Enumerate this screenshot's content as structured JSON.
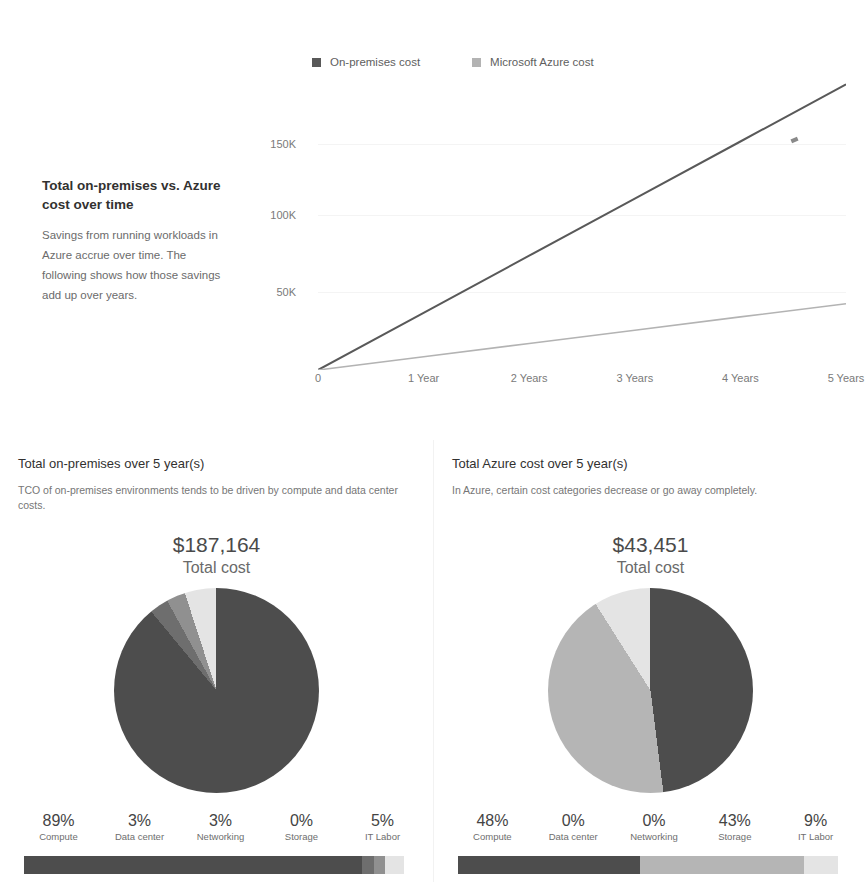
{
  "colors": {
    "onprem_line": "#595959",
    "azure_line": "#b3b3b3",
    "slice_compute": "#4d4d4d",
    "slice_datacenter": "#6e6e6e",
    "slice_networking": "#909090",
    "slice_storage": "#b5b5b5",
    "slice_itlabor": "#e4e4e4",
    "text_primary": "#323130",
    "text_muted": "#6b6b6b"
  },
  "overview": {
    "title": "Total on-premises vs. Azure cost over time",
    "body": "Savings from running workloads in Azure accrue over time. The following shows how those savings add up over years."
  },
  "chart_data": {
    "type": "line",
    "title": "Total on-premises vs. Azure cost over time",
    "xlabel": "",
    "ylabel": "",
    "x": [
      0,
      1,
      2,
      3,
      4,
      5
    ],
    "x_tick_labels": [
      "0",
      "1 Year",
      "2 Years",
      "3 Years",
      "4 Years",
      "5 Years"
    ],
    "y_tick_labels": [
      "50K",
      "100K",
      "150K"
    ],
    "y_tick_values": [
      50000,
      100000,
      150000
    ],
    "ylim": [
      0,
      190000
    ],
    "grid": false,
    "legend_position": "top",
    "series": [
      {
        "name": "On-premises cost",
        "color": "#595959",
        "values": [
          0,
          37433,
          74866,
          112298,
          149731,
          187164
        ]
      },
      {
        "name": "Microsoft Azure cost",
        "color": "#b3b3b3",
        "values": [
          0,
          8690,
          17380,
          26071,
          34761,
          43451
        ]
      }
    ]
  },
  "panels": [
    {
      "id": "on-premises",
      "title": "Total on-premises over 5 year(s)",
      "subtitle": "TCO of on-premises environments tends to be driven by compute and data center costs.",
      "total_amount": "$187,164",
      "total_caption": "Total cost",
      "pie": {
        "type": "pie",
        "labels": [
          "Compute",
          "Data center",
          "Networking",
          "Storage",
          "IT Labor"
        ],
        "percentages": [
          89,
          3,
          3,
          0,
          5
        ],
        "colors": [
          "#4d4d4d",
          "#6e6e6e",
          "#909090",
          "#b5b5b5",
          "#e4e4e4"
        ]
      },
      "breakdown": [
        {
          "pct": "89%",
          "name": "Compute",
          "color": "#4d4d4d",
          "width": 89
        },
        {
          "pct": "3%",
          "name": "Data center",
          "color": "#6e6e6e",
          "width": 3
        },
        {
          "pct": "3%",
          "name": "Networking",
          "color": "#909090",
          "width": 3
        },
        {
          "pct": "0%",
          "name": "Storage",
          "color": "#b5b5b5",
          "width": 0
        },
        {
          "pct": "5%",
          "name": "IT Labor",
          "color": "#e4e4e4",
          "width": 5
        }
      ]
    },
    {
      "id": "azure",
      "title": "Total Azure cost over 5 year(s)",
      "subtitle": "In Azure, certain cost categories decrease or go away completely.",
      "total_amount": "$43,451",
      "total_caption": "Total cost",
      "pie": {
        "type": "pie",
        "labels": [
          "Compute",
          "Data center",
          "Networking",
          "Storage",
          "IT Labor"
        ],
        "percentages": [
          48,
          0,
          0,
          43,
          9
        ],
        "colors": [
          "#4d4d4d",
          "#6e6e6e",
          "#909090",
          "#b5b5b5",
          "#e4e4e4"
        ]
      },
      "breakdown": [
        {
          "pct": "48%",
          "name": "Compute",
          "color": "#4d4d4d",
          "width": 48
        },
        {
          "pct": "0%",
          "name": "Data center",
          "color": "#6e6e6e",
          "width": 0
        },
        {
          "pct": "0%",
          "name": "Networking",
          "color": "#909090",
          "width": 0
        },
        {
          "pct": "43%",
          "name": "Storage",
          "color": "#b5b5b5",
          "width": 43
        },
        {
          "pct": "9%",
          "name": "IT Labor",
          "color": "#e4e4e4",
          "width": 9
        }
      ]
    }
  ]
}
